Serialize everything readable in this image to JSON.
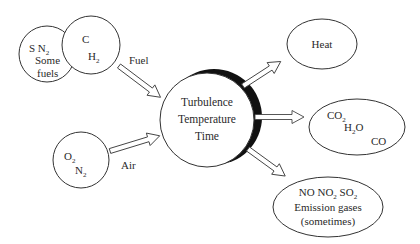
{
  "diagram": {
    "inputs": {
      "fuel_other": {
        "line1": "S  N",
        "line1_sub": "2",
        "line2": "Some",
        "line3": "fuels"
      },
      "fuel_main": {
        "line1": "C",
        "line2": "H",
        "line2_sub": "2"
      },
      "fuel_label": "Fuel",
      "air": {
        "line1": "O",
        "line1_sub": "2",
        "line2": "N",
        "line2_sub": "2"
      },
      "air_label": "Air"
    },
    "center": {
      "line1": "Turbulence",
      "line2": "Temperature",
      "line3": "Time"
    },
    "outputs": {
      "heat": {
        "label": "Heat"
      },
      "products": {
        "co2": "CO",
        "co2_sub": "2",
        "h2o_a": "H",
        "h2o_sub": "2",
        "h2o_b": "O",
        "co": "CO"
      },
      "emissions": {
        "no": "NO",
        "no2": "NO",
        "no2_sub": "2",
        "so2": "SO",
        "so2_sub": "2",
        "line2": "Emission gases",
        "line3": "(sometimes)"
      }
    },
    "colors": {
      "stroke": "#333333",
      "crescent": "#111111",
      "text": "#2a2a2a",
      "background": "#ffffff"
    }
  }
}
